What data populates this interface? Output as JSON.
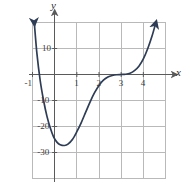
{
  "chart_data": {
    "type": "line",
    "title": "",
    "xlabel": "x",
    "ylabel": "y",
    "xlim": [
      -1.2,
      5.0
    ],
    "ylim": [
      -40,
      20
    ],
    "grid": true,
    "legend": null,
    "x_ticks": [
      -1,
      1,
      2,
      3,
      4
    ],
    "x_tick_labels": [
      "-1",
      "1",
      "2",
      "3",
      "4"
    ],
    "y_ticks": [
      10,
      -10,
      -20,
      -30
    ],
    "y_tick_labels": [
      "10",
      "-10",
      "-20",
      "-30"
    ],
    "x_gridlines": [
      -1,
      0,
      1,
      2,
      3,
      4,
      5
    ],
    "y_gridlines": [
      20,
      10,
      0,
      -10,
      -20,
      -30,
      -40
    ],
    "series": [
      {
        "name": "curve",
        "color": "#2e3d55",
        "arrow_start": true,
        "arrow_end": true,
        "points": [
          [
            -0.92,
            20.0
          ],
          [
            -0.8,
            8.0
          ],
          [
            -0.65,
            -2.5
          ],
          [
            -0.5,
            -10.0
          ],
          [
            -0.35,
            -16.0
          ],
          [
            -0.2,
            -20.5
          ],
          [
            -0.05,
            -24.0
          ],
          [
            0.1,
            -26.0
          ],
          [
            0.25,
            -27.0
          ],
          [
            0.45,
            -27.3
          ],
          [
            0.6,
            -26.8
          ],
          [
            0.8,
            -25.0
          ],
          [
            1.0,
            -22.0
          ],
          [
            1.2,
            -18.5
          ],
          [
            1.4,
            -14.5
          ],
          [
            1.6,
            -10.5
          ],
          [
            1.8,
            -7.0
          ],
          [
            2.0,
            -4.2
          ],
          [
            2.2,
            -2.2
          ],
          [
            2.4,
            -1.0
          ],
          [
            2.6,
            -0.4
          ],
          [
            2.8,
            -0.1
          ],
          [
            3.0,
            0.0
          ],
          [
            3.2,
            0.1
          ],
          [
            3.4,
            0.5
          ],
          [
            3.6,
            1.5
          ],
          [
            3.8,
            3.2
          ],
          [
            4.0,
            6.0
          ],
          [
            4.2,
            10.0
          ],
          [
            4.4,
            15.0
          ],
          [
            4.55,
            19.5
          ]
        ]
      }
    ],
    "annotations": {
      "minimum_approx": [
        0.45,
        -27
      ],
      "inflection_plateau_approx": [
        3,
        0
      ]
    }
  },
  "axes": {
    "y_axis_label": "y",
    "x_axis_label": "x"
  },
  "colors": {
    "curve": "#2e3d55",
    "grid": "#b9b9b9",
    "axis": "#5a5a5a",
    "background": "#ffffff",
    "tick_text": "#3a3a3a"
  }
}
